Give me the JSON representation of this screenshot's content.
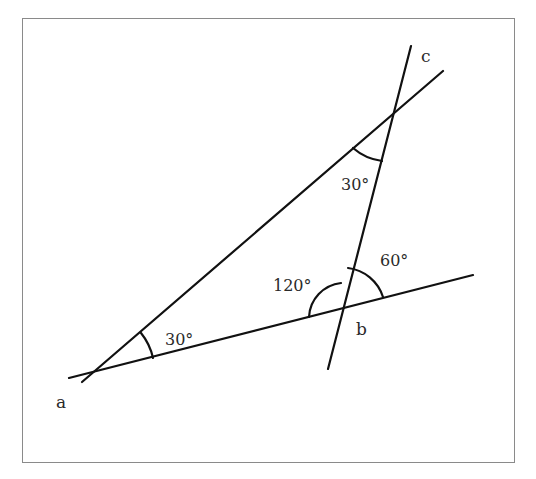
{
  "diagram": {
    "type": "geometry-angles",
    "frame": {
      "x": 22,
      "y": 18,
      "width": 492,
      "height": 444,
      "border_color": "#8a8a8a"
    },
    "line_color": "#111111",
    "lines": [
      {
        "id": "line-a-to-upper-right",
        "x1": 82,
        "y1": 382,
        "x2": 443,
        "y2": 71
      },
      {
        "id": "line-transversal-a-b",
        "x1": 69,
        "y1": 378,
        "x2": 473,
        "y2": 275
      },
      {
        "id": "line-through-b-c",
        "x1": 411,
        "y1": 46,
        "x2": 328,
        "y2": 369
      }
    ],
    "points": [
      {
        "name": "a",
        "label": "a",
        "x": 96,
        "y": 372,
        "label_x": 56,
        "label_y": 408
      },
      {
        "name": "b",
        "label": "b",
        "x": 345,
        "y": 309,
        "label_x": 356,
        "label_y": 335
      },
      {
        "name": "c",
        "label": "c",
        "x": 411,
        "y": 46,
        "label_x": 421,
        "label_y": 62
      }
    ],
    "angles": [
      {
        "id": "angle-a",
        "label": "30°",
        "vertex": [
          96,
          372
        ],
        "label_x": 165,
        "label_y": 345
      },
      {
        "id": "angle-top",
        "label": "30°",
        "vertex": [
          394,
          113
        ],
        "label_x": 341,
        "label_y": 190
      },
      {
        "id": "angle-b-left",
        "label": "120°",
        "vertex": [
          345,
          309
        ],
        "label_x": 273,
        "label_y": 291
      },
      {
        "id": "angle-b-right",
        "label": "60°",
        "vertex": [
          345,
          309
        ],
        "label_x": 380,
        "label_y": 266
      }
    ]
  }
}
